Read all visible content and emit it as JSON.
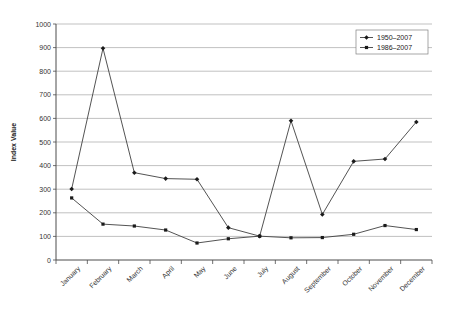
{
  "chart_data": {
    "type": "line",
    "title": "",
    "xlabel": "",
    "ylabel": "Index Value",
    "ylim": [
      0,
      1000
    ],
    "ytick_step": 100,
    "yticks": [
      "0",
      "100",
      "200",
      "300",
      "400",
      "500",
      "600",
      "700",
      "800",
      "900",
      "1000"
    ],
    "grid": true,
    "legend_position": "top-right",
    "categories": [
      "January",
      "February",
      "March",
      "April",
      "May",
      "June",
      "July",
      "August",
      "September",
      "October",
      "November",
      "December"
    ],
    "series": [
      {
        "name": "1950–2007",
        "marker": "diamond",
        "color": "#404040",
        "values": [
          301,
          897,
          370,
          345,
          342,
          137,
          101,
          590,
          193,
          418,
          428,
          585
        ]
      },
      {
        "name": "1986–2007",
        "marker": "square",
        "color": "#404040",
        "values": [
          263,
          152,
          144,
          127,
          72,
          90,
          101,
          94,
          95,
          109,
          146,
          129
        ]
      }
    ]
  }
}
